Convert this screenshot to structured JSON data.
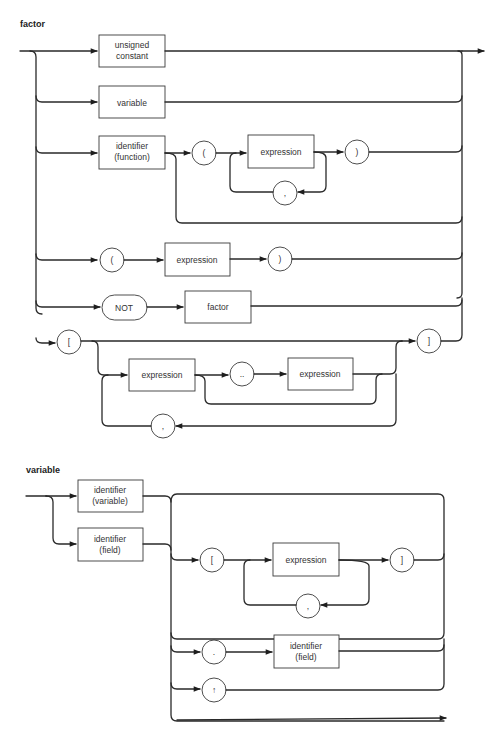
{
  "diagrams": [
    {
      "title": "factor",
      "nodes": {
        "unsigned_constant": {
          "type": "box",
          "line1": "unsigned",
          "line2": "constant"
        },
        "variable": {
          "type": "box",
          "label": "variable"
        },
        "identifier_function": {
          "type": "box",
          "line1": "identifier",
          "line2": "(function)"
        },
        "lparen_fn": {
          "type": "terminal",
          "label": "("
        },
        "expression_fn": {
          "type": "box",
          "label": "expression"
        },
        "comma_fn": {
          "type": "terminal",
          "label": ","
        },
        "rparen_fn": {
          "type": "terminal",
          "label": ")"
        },
        "lparen": {
          "type": "terminal",
          "label": "("
        },
        "expression_paren": {
          "type": "box",
          "label": "expression"
        },
        "rparen": {
          "type": "terminal",
          "label": ")"
        },
        "not": {
          "type": "terminal",
          "label": "NOT"
        },
        "factor": {
          "type": "box",
          "label": "factor"
        },
        "lbracket": {
          "type": "terminal",
          "label": "["
        },
        "expression_set1": {
          "type": "box",
          "label": "expression"
        },
        "dotdot": {
          "type": "terminal",
          "label": ".."
        },
        "expression_set2": {
          "type": "box",
          "label": "expression"
        },
        "comma_set": {
          "type": "terminal",
          "label": ","
        },
        "rbracket": {
          "type": "terminal",
          "label": "]"
        }
      }
    },
    {
      "title": "variable",
      "nodes": {
        "identifier_variable": {
          "type": "box",
          "line1": "identifier",
          "line2": "(variable)"
        },
        "identifier_field": {
          "type": "box",
          "line1": "identifier",
          "line2": "(field)"
        },
        "lbracket": {
          "type": "terminal",
          "label": "["
        },
        "expression": {
          "type": "box",
          "label": "expression"
        },
        "rbracket": {
          "type": "terminal",
          "label": "]"
        },
        "comma": {
          "type": "terminal",
          "label": ","
        },
        "dot": {
          "type": "terminal",
          "label": "."
        },
        "identifier_field2": {
          "type": "box",
          "line1": "identifier",
          "line2": "(field)"
        },
        "pointer": {
          "type": "terminal",
          "label": "↑"
        }
      }
    }
  ],
  "colors": {
    "line": "#2a2a2a",
    "background": "#ffffff",
    "text": "#333333"
  }
}
